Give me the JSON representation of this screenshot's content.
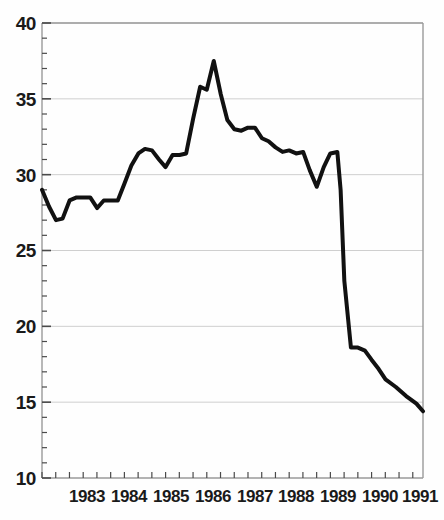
{
  "chart_data": {
    "type": "line",
    "title": "",
    "subtitle": "",
    "xlabel": "",
    "ylabel": "",
    "xlim": [
      1982.58,
      1991.83
    ],
    "ylim": [
      10,
      40
    ],
    "yticks": [
      10,
      15,
      20,
      25,
      30,
      35,
      40
    ],
    "ytick_labels": [
      "10",
      "15",
      "20",
      "25",
      "30",
      "35",
      "40"
    ],
    "y_minor_tick_step": 1,
    "xticks": [
      1983,
      1984,
      1985,
      1986,
      1987,
      1988,
      1989,
      1990,
      1991
    ],
    "xtick_labels": [
      "1983",
      "1984",
      "1985",
      "1986",
      "1987",
      "1988",
      "1989",
      "1990",
      "1991"
    ],
    "x_minor_tick_step": 0.1667,
    "grid": "horizontal-major-only",
    "legend": "none",
    "line_color": "#111111",
    "grid_color": "#cfcfcf",
    "axis_color": "#9a9a9a",
    "background_color": "#fefefe",
    "series": [
      {
        "name": "value",
        "x": [
          1982.58,
          1982.75,
          1982.92,
          1983.08,
          1983.25,
          1983.42,
          1983.58,
          1983.75,
          1983.92,
          1984.08,
          1984.25,
          1984.42,
          1984.58,
          1984.75,
          1984.92,
          1985.08,
          1985.25,
          1985.42,
          1985.58,
          1985.75,
          1985.92,
          1986.08,
          1986.25,
          1986.42,
          1986.58,
          1986.75,
          1986.92,
          1987.08,
          1987.25,
          1987.42,
          1987.58,
          1987.75,
          1987.92,
          1988.08,
          1988.25,
          1988.42,
          1988.58,
          1988.75,
          1988.92,
          1989.08,
          1989.25,
          1989.42,
          1989.58,
          1989.75,
          1989.83,
          1989.92,
          1990.08,
          1990.25,
          1990.42,
          1990.58,
          1990.75,
          1990.92,
          1991.17,
          1991.42,
          1991.67,
          1991.83
        ],
        "values": [
          29.0,
          27.9,
          27.0,
          27.1,
          28.3,
          28.5,
          28.5,
          28.5,
          27.8,
          28.3,
          28.3,
          28.3,
          29.4,
          30.6,
          31.4,
          31.7,
          31.6,
          31.0,
          30.5,
          31.3,
          31.3,
          31.4,
          33.7,
          35.8,
          35.6,
          37.5,
          35.3,
          33.6,
          33.0,
          32.9,
          33.1,
          33.1,
          32.4,
          32.2,
          31.8,
          31.5,
          31.6,
          31.4,
          31.5,
          30.3,
          29.2,
          30.5,
          31.4,
          31.5,
          29.0,
          23.0,
          18.6,
          18.6,
          18.4,
          17.8,
          17.2,
          16.5,
          16.0,
          15.4,
          14.9,
          14.4
        ]
      }
    ]
  },
  "axes": {
    "y_tick_labels": [
      "40",
      "35",
      "30",
      "25",
      "20",
      "15",
      "10"
    ],
    "x_tick_labels": [
      "1983",
      "1984",
      "1985",
      "1986",
      "1987",
      "1988",
      "1989",
      "1990",
      "1991"
    ]
  }
}
